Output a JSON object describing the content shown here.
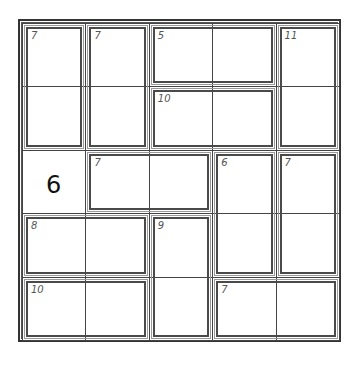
{
  "puzzle": {
    "type": "killer-sudoku-5x5",
    "size": 5,
    "grid_origin": {
      "x": 22,
      "y": 23
    },
    "cell_size": 63.4,
    "givens": [
      {
        "row": 2,
        "col": 0,
        "value": "6"
      }
    ],
    "cages": [
      {
        "clue": "7",
        "cells": [
          [
            0,
            0
          ],
          [
            1,
            0
          ]
        ]
      },
      {
        "clue": "7",
        "cells": [
          [
            0,
            1
          ],
          [
            1,
            1
          ]
        ]
      },
      {
        "clue": "5",
        "cells": [
          [
            0,
            2
          ],
          [
            0,
            3
          ]
        ]
      },
      {
        "clue": "11",
        "cells": [
          [
            0,
            4
          ],
          [
            1,
            4
          ]
        ]
      },
      {
        "clue": "10",
        "cells": [
          [
            1,
            2
          ],
          [
            1,
            3
          ]
        ]
      },
      {
        "clue": "7",
        "cells": [
          [
            2,
            1
          ],
          [
            2,
            2
          ]
        ]
      },
      {
        "clue": "6",
        "cells": [
          [
            2,
            3
          ],
          [
            3,
            3
          ]
        ]
      },
      {
        "clue": "7",
        "cells": [
          [
            2,
            4
          ],
          [
            3,
            4
          ]
        ]
      },
      {
        "clue": "8",
        "cells": [
          [
            3,
            0
          ],
          [
            3,
            1
          ]
        ]
      },
      {
        "clue": "9",
        "cells": [
          [
            3,
            2
          ],
          [
            4,
            2
          ]
        ]
      },
      {
        "clue": "10",
        "cells": [
          [
            4,
            0
          ],
          [
            4,
            1
          ]
        ]
      },
      {
        "clue": "7",
        "cells": [
          [
            4,
            3
          ],
          [
            4,
            4
          ]
        ]
      }
    ]
  }
}
